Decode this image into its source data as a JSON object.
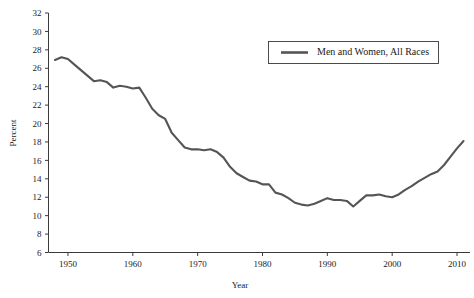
{
  "chart_data": {
    "type": "line",
    "title": "",
    "xlabel": "Year",
    "ylabel": "Percent",
    "xlim": [
      1947,
      2012
    ],
    "ylim": [
      6,
      32
    ],
    "grid": false,
    "legend_position": "top-right",
    "line_color": "#555555",
    "x_ticks": [
      1950,
      1960,
      1970,
      1980,
      1990,
      2000,
      2010
    ],
    "y_ticks": [
      6,
      8,
      10,
      12,
      14,
      16,
      18,
      20,
      22,
      24,
      26,
      28,
      30,
      32
    ],
    "series": [
      {
        "name": "Men and Women, All Races",
        "color": "#555555",
        "x": [
          1948,
          1949,
          1950,
          1951,
          1952,
          1953,
          1954,
          1955,
          1956,
          1957,
          1958,
          1959,
          1960,
          1961,
          1962,
          1963,
          1964,
          1965,
          1966,
          1967,
          1968,
          1969,
          1970,
          1971,
          1972,
          1973,
          1974,
          1975,
          1976,
          1977,
          1978,
          1979,
          1980,
          1981,
          1982,
          1983,
          1984,
          1985,
          1986,
          1987,
          1988,
          1989,
          1990,
          1991,
          1992,
          1993,
          1994,
          1995,
          1996,
          1997,
          1998,
          1999,
          2000,
          2001,
          2002,
          2003,
          2004,
          2005,
          2006,
          2007,
          2008,
          2009,
          2010,
          2011
        ],
        "values": [
          26.9,
          27.2,
          27.0,
          26.4,
          25.8,
          25.2,
          24.6,
          24.7,
          24.5,
          23.9,
          24.1,
          24.0,
          23.8,
          23.9,
          22.8,
          21.6,
          20.9,
          20.5,
          19.0,
          18.2,
          17.4,
          17.2,
          17.2,
          17.1,
          17.2,
          16.9,
          16.3,
          15.3,
          14.6,
          14.2,
          13.8,
          13.7,
          13.4,
          13.4,
          12.5,
          12.3,
          11.9,
          11.4,
          11.2,
          11.1,
          11.3,
          11.6,
          11.9,
          11.7,
          11.7,
          11.6,
          11.0,
          11.6,
          12.2,
          12.2,
          12.3,
          12.1,
          12.0,
          12.3,
          12.8,
          13.2,
          13.7,
          14.1,
          14.5,
          14.8,
          15.5,
          16.4,
          17.3,
          18.1
        ]
      }
    ]
  },
  "legend": {
    "entries": [
      {
        "label": "Men and Women, All Races"
      }
    ]
  },
  "axes": {
    "y_title": "Percent",
    "x_title": "Year"
  }
}
